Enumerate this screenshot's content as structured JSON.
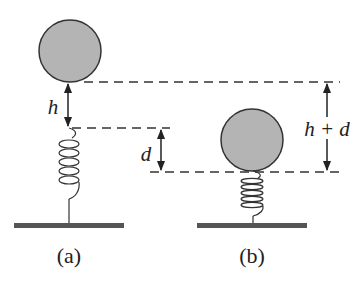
{
  "diagram": {
    "type": "physics-spring-ball",
    "colors": {
      "ball_fill": "#b4b4b4",
      "ball_stroke": "#333333",
      "line": "#222222",
      "ground": "#555555"
    },
    "panels": [
      {
        "id": "a",
        "caption": "(a)",
        "ball": {
          "cx": 70,
          "cy": 51,
          "r": 31
        },
        "spring": {
          "x": 69,
          "top": 128,
          "coil_start": 138,
          "coil_end": 190,
          "coils": 6,
          "half_width": 10,
          "bottom": 226
        },
        "ground": {
          "x1": 14,
          "x2": 124,
          "y": 226
        }
      },
      {
        "id": "b",
        "caption": "(b)",
        "ball": {
          "cx": 252,
          "cy": 140,
          "r": 31
        },
        "spring": {
          "x": 253,
          "top": 171,
          "coil_start": 176,
          "coil_end": 214,
          "coils": 6,
          "half_width": 11,
          "bottom": 226
        },
        "ground": {
          "x1": 197,
          "x2": 307,
          "y": 226
        }
      }
    ],
    "labels": {
      "h": "h",
      "d": "d",
      "h_plus_d": "h + d"
    },
    "dimensions": [
      {
        "name": "h",
        "x": 68,
        "y1": 82,
        "y2": 128
      },
      {
        "name": "d",
        "x": 161,
        "y1": 129,
        "y2": 172
      },
      {
        "name": "h+d",
        "x": 327,
        "y1": 82,
        "y2": 172
      }
    ],
    "dashed_lines": [
      {
        "name": "ball-a-bottom",
        "x1": 84,
        "x2": 340,
        "y": 82
      },
      {
        "name": "spring-a-top",
        "x1": 72,
        "x2": 170,
        "y": 128
      },
      {
        "name": "ball-b-bottom",
        "x1": 150,
        "x2": 340,
        "y": 172
      }
    ]
  }
}
